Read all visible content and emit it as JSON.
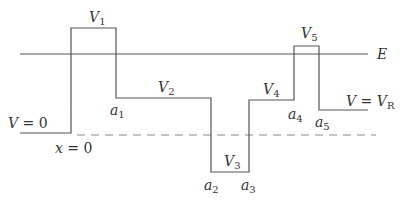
{
  "diagram": {
    "type": "piecewise-constant potential energy diagram",
    "colors": {
      "line": "#555555",
      "dashed": "#8a8a8a",
      "text": "#333333",
      "background": "#ffffff"
    },
    "energy_line": {
      "label": "E",
      "y": 54,
      "x_start": 20,
      "x_end": 368
    },
    "reference_dashed": {
      "y": 135,
      "x_start": 77,
      "x_end": 376
    },
    "potential_path": [
      [
        20,
        133
      ],
      [
        71,
        133
      ],
      [
        71,
        28
      ],
      [
        116,
        28
      ],
      [
        116,
        98
      ],
      [
        211,
        98
      ],
      [
        211,
        172
      ],
      [
        249,
        172
      ],
      [
        249,
        100
      ],
      [
        294,
        100
      ],
      [
        294,
        46
      ],
      [
        319,
        46
      ],
      [
        319,
        110
      ],
      [
        368,
        110
      ]
    ],
    "labels": {
      "v0": {
        "main": "V",
        "eq": " = 0"
      },
      "x0": {
        "main": "x",
        "eq": " = 0"
      },
      "v1": {
        "main": "V",
        "sub": "1"
      },
      "v2": {
        "main": "V",
        "sub": "2"
      },
      "v3": {
        "main": "V",
        "sub": "3"
      },
      "v4": {
        "main": "V",
        "sub": "4"
      },
      "v5": {
        "main": "V",
        "sub": "5"
      },
      "vr": {
        "main": "V",
        "eq": " = ",
        "main2": "V",
        "sub": "R"
      },
      "a1": {
        "main": "a",
        "sub": "1"
      },
      "a2": {
        "main": "a",
        "sub": "2"
      },
      "a3": {
        "main": "a",
        "sub": "3"
      },
      "a4": {
        "main": "a",
        "sub": "4"
      },
      "a5": {
        "main": "a",
        "sub": "5"
      },
      "e": {
        "main": "E"
      }
    }
  }
}
